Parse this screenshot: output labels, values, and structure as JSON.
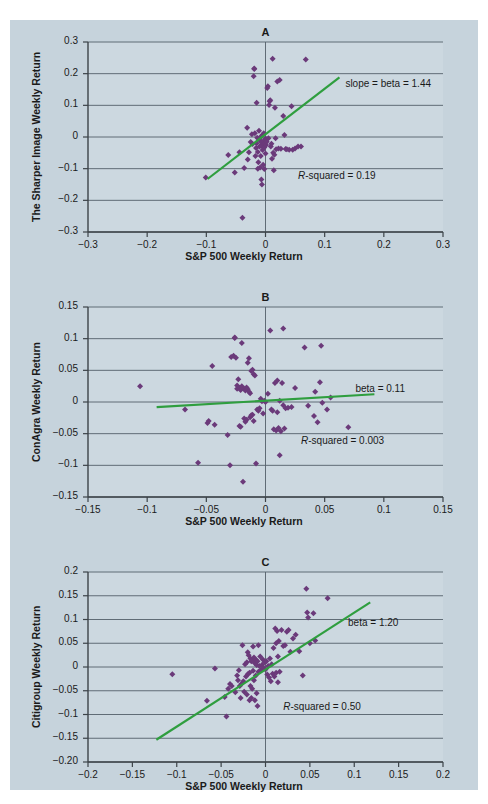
{
  "figure": {
    "background_color": "#c6d3dc",
    "plot_color": "#ccd8e0",
    "marker_color": "#6b3a7a",
    "line_color": "#2f9e3f",
    "axis_color": "#3c4348",
    "grid_color": "#54606a",
    "top_note": ""
  },
  "common": {
    "xlabel": "S&P 500 Weekly Return"
  },
  "chart_data": [
    {
      "id": "A",
      "type": "scatter",
      "title": "A",
      "xlabel": "S&P 500 Weekly Return",
      "ylabel": "The Sharper Image Weekly Return",
      "xlim": [
        -0.3,
        0.3
      ],
      "ylim": [
        -0.3,
        0.3
      ],
      "xticks": [
        -0.3,
        -0.2,
        -0.1,
        0,
        0.1,
        0.2,
        0.3
      ],
      "xticklabels": [
        "−0.3",
        "−0.2",
        "−0.1",
        "0",
        "0.1",
        "0.2",
        "0.3"
      ],
      "yticks": [
        -0.3,
        -0.2,
        -0.1,
        0,
        0.1,
        0.2,
        0.3
      ],
      "yticklabels": [
        "−0.3",
        "−0.2",
        "−0.1",
        "0",
        "0.1",
        "0.2",
        "0.3"
      ],
      "grid": "horizontal",
      "annotations": [
        {
          "name": "slope-annotation",
          "text": "slope = beta = 1.44",
          "x": 0.135,
          "y": 0.165
        },
        {
          "name": "rsquared-annotation",
          "text": "R-squared = 0.19",
          "italic_prefix": "R",
          "rest": "-squared = 0.19",
          "x": 0.055,
          "y": -0.125
        }
      ],
      "fit": {
        "slope": 1.44,
        "intercept": 0.0085,
        "x_start": -0.098,
        "x_end": 0.125
      },
      "beta": 1.44,
      "r_squared": 0.19,
      "points": [
        [
          -0.101,
          -0.128
        ],
        [
          -0.063,
          -0.057
        ],
        [
          -0.052,
          -0.112
        ],
        [
          -0.044,
          -0.048
        ],
        [
          -0.039,
          -0.255
        ],
        [
          -0.036,
          -0.098
        ],
        [
          -0.031,
          0.029
        ],
        [
          -0.03,
          -0.071
        ],
        [
          -0.028,
          -0.048
        ],
        [
          -0.025,
          -0.016
        ],
        [
          -0.023,
          0.009
        ],
        [
          -0.022,
          -0.022
        ],
        [
          -0.02,
          0.192
        ],
        [
          -0.019,
          0.215
        ],
        [
          -0.019,
          0.216
        ],
        [
          -0.018,
          0.012
        ],
        [
          -0.017,
          -0.06
        ],
        [
          -0.016,
          -0.035
        ],
        [
          -0.015,
          0.108
        ],
        [
          -0.015,
          -0.02
        ],
        [
          -0.014,
          -0.002
        ],
        [
          -0.013,
          -0.047
        ],
        [
          -0.013,
          -0.1
        ],
        [
          -0.012,
          -0.08
        ],
        [
          -0.011,
          0.02
        ],
        [
          -0.01,
          -0.005
        ],
        [
          -0.01,
          -0.03
        ],
        [
          -0.009,
          -0.012
        ],
        [
          -0.009,
          -0.096
        ],
        [
          -0.008,
          0.001
        ],
        [
          -0.008,
          -0.06
        ],
        [
          -0.007,
          -0.028
        ],
        [
          -0.007,
          -0.134
        ],
        [
          -0.006,
          -0.018
        ],
        [
          -0.006,
          -0.15
        ],
        [
          -0.005,
          0.006
        ],
        [
          -0.005,
          -0.041
        ],
        [
          -0.004,
          -0.022
        ],
        [
          -0.004,
          -0.088
        ],
        [
          -0.003,
          0.012
        ],
        [
          -0.003,
          -0.012
        ],
        [
          -0.002,
          -0.033
        ],
        [
          -0.002,
          -0.101
        ],
        [
          -0.001,
          -0.019
        ],
        [
          0.0,
          -0.005
        ],
        [
          0.0,
          -0.052
        ],
        [
          0.001,
          -0.025
        ],
        [
          0.002,
          -0.015
        ],
        [
          0.003,
          0.155
        ],
        [
          0.004,
          0.16
        ],
        [
          0.005,
          -0.004
        ],
        [
          0.006,
          0.101
        ],
        [
          0.007,
          0.113
        ],
        [
          0.008,
          0.116
        ],
        [
          0.009,
          -0.03
        ],
        [
          0.01,
          -0.021
        ],
        [
          0.011,
          -0.069
        ],
        [
          0.012,
          0.247
        ],
        [
          0.013,
          -0.05
        ],
        [
          0.014,
          -0.105
        ],
        [
          0.015,
          -0.056
        ],
        [
          0.016,
          0.092
        ],
        [
          0.017,
          -0.004
        ],
        [
          0.018,
          -0.039
        ],
        [
          0.02,
          0.175
        ],
        [
          0.022,
          -0.036
        ],
        [
          0.024,
          0.18
        ],
        [
          0.026,
          -0.037
        ],
        [
          0.03,
          0.066
        ],
        [
          0.032,
          0.006
        ],
        [
          0.034,
          -0.038
        ],
        [
          0.036,
          -0.039
        ],
        [
          0.04,
          -0.04
        ],
        [
          0.044,
          0.097
        ],
        [
          0.046,
          -0.04
        ],
        [
          0.05,
          -0.036
        ],
        [
          0.055,
          -0.03
        ],
        [
          0.06,
          -0.03
        ],
        [
          0.068,
          0.245
        ]
      ]
    },
    {
      "id": "B",
      "type": "scatter",
      "title": "B",
      "xlabel": "S&P 500 Weekly Return",
      "ylabel": "ConAgra Weekly Return",
      "xlim": [
        -0.15,
        0.15
      ],
      "ylim": [
        -0.15,
        0.15
      ],
      "xticks": [
        -0.15,
        -0.1,
        -0.05,
        0,
        0.05,
        0.1,
        0.15
      ],
      "xticklabels": [
        "−0.15",
        "−0.1",
        "−0.05",
        "0",
        "0.05",
        "0.1",
        "0.15"
      ],
      "yticks": [
        -0.15,
        -0.1,
        -0.05,
        0,
        0.05,
        0.1,
        0.15
      ],
      "yticklabels": [
        "−0.15",
        "−0.1",
        "−0.05",
        "0",
        "0.05",
        "0.1",
        "0.15"
      ],
      "grid": "horizontal",
      "annotations": [
        {
          "name": "beta-annotation",
          "text": "beta = 0.11",
          "x": 0.076,
          "y": 0.019
        },
        {
          "name": "rsquared-annotation",
          "text": "R-squared = 0.003",
          "italic_prefix": "R",
          "rest": "-squared = 0.003",
          "x": 0.03,
          "y": -0.063
        }
      ],
      "fit": {
        "slope": 0.11,
        "intercept": 0.0021,
        "x_start": -0.092,
        "x_end": 0.092
      },
      "beta": 0.11,
      "r_squared": 0.003,
      "points": [
        [
          -0.106,
          0.025
        ],
        [
          -0.068,
          -0.012
        ],
        [
          -0.057,
          -0.096
        ],
        [
          -0.049,
          -0.033
        ],
        [
          -0.048,
          -0.03
        ],
        [
          -0.045,
          0.057
        ],
        [
          -0.043,
          -0.036
        ],
        [
          -0.032,
          -0.052
        ],
        [
          -0.03,
          -0.1
        ],
        [
          -0.029,
          0.071
        ],
        [
          -0.027,
          0.073
        ],
        [
          -0.026,
          0.101
        ],
        [
          -0.026,
          0.102
        ],
        [
          -0.025,
          0.07
        ],
        [
          -0.024,
          0.026
        ],
        [
          -0.024,
          0.021
        ],
        [
          -0.023,
          0.036
        ],
        [
          -0.022,
          0.022
        ],
        [
          -0.022,
          -0.038
        ],
        [
          -0.021,
          0.019
        ],
        [
          -0.021,
          -0.039
        ],
        [
          -0.02,
          0.025
        ],
        [
          -0.02,
          0.093
        ],
        [
          -0.019,
          -0.126
        ],
        [
          -0.018,
          0.021
        ],
        [
          -0.018,
          -0.026
        ],
        [
          -0.017,
          0.018
        ],
        [
          -0.017,
          -0.031
        ],
        [
          -0.016,
          0.023
        ],
        [
          -0.016,
          -0.028
        ],
        [
          -0.015,
          0.02
        ],
        [
          -0.015,
          0.062
        ],
        [
          -0.014,
          0.016
        ],
        [
          -0.014,
          0.069
        ],
        [
          -0.013,
          0.014
        ],
        [
          -0.013,
          -0.024
        ],
        [
          -0.012,
          0.049
        ],
        [
          -0.012,
          -0.021
        ],
        [
          -0.011,
          0.051
        ],
        [
          -0.011,
          -0.02
        ],
        [
          -0.01,
          0.044
        ],
        [
          -0.01,
          -0.03
        ],
        [
          -0.009,
          0.042
        ],
        [
          -0.008,
          -0.097
        ],
        [
          -0.007,
          -0.012
        ],
        [
          -0.006,
          -0.014
        ],
        [
          -0.005,
          -0.01
        ],
        [
          -0.004,
          0.005
        ],
        [
          -0.003,
          0.001
        ],
        [
          -0.002,
          -0.018
        ],
        [
          -0.001,
          0.002
        ],
        [
          0.0,
          0.0
        ],
        [
          0.002,
          0.013
        ],
        [
          0.004,
          0.113
        ],
        [
          0.005,
          -0.012
        ],
        [
          0.006,
          -0.014
        ],
        [
          0.007,
          -0.043
        ],
        [
          0.008,
          0.03
        ],
        [
          0.009,
          -0.045
        ],
        [
          0.01,
          0.034
        ],
        [
          0.01,
          -0.016
        ],
        [
          0.011,
          -0.041
        ],
        [
          0.012,
          0.002
        ],
        [
          0.012,
          -0.084
        ],
        [
          0.013,
          -0.046
        ],
        [
          0.014,
          0.03
        ],
        [
          0.015,
          0.116
        ],
        [
          0.015,
          -0.005
        ],
        [
          0.016,
          -0.042
        ],
        [
          0.017,
          -0.01
        ],
        [
          0.019,
          -0.009
        ],
        [
          0.022,
          -0.008
        ],
        [
          0.025,
          0.022
        ],
        [
          0.033,
          0.086
        ],
        [
          0.036,
          -0.006
        ],
        [
          0.041,
          -0.022
        ],
        [
          0.042,
          0.016
        ],
        [
          0.044,
          -0.032
        ],
        [
          0.046,
          0.031
        ],
        [
          0.047,
          0.089
        ],
        [
          0.048,
          -0.001
        ],
        [
          0.052,
          -0.012
        ],
        [
          0.055,
          0.007
        ],
        [
          0.07,
          -0.04
        ]
      ]
    },
    {
      "id": "C",
      "type": "scatter",
      "title": "C",
      "xlabel": "S&P 500 Weekly Return",
      "ylabel": "Citigroup Weekly Return",
      "xlim": [
        -0.2,
        0.2
      ],
      "ylim": [
        -0.2,
        0.2
      ],
      "xticks": [
        -0.2,
        -0.15,
        -0.1,
        -0.05,
        0,
        0.05,
        0.1,
        0.15,
        0.2
      ],
      "xticklabels": [
        "−0.2",
        "−0.15",
        "−0.1",
        "−0.05",
        "0",
        "0.05",
        "0.1",
        "0.15",
        "0.2"
      ],
      "yticks": [
        -0.2,
        -0.15,
        -0.1,
        -0.05,
        0,
        0.05,
        0.1,
        0.15,
        0.2
      ],
      "yticklabels": [
        "−0.20",
        "−0.15",
        "−0.1",
        "−0.05",
        "0",
        "0.05",
        "0.1",
        "0.15",
        "0.2"
      ],
      "grid": "horizontal",
      "annotations": [
        {
          "name": "beta-annotation",
          "text": "beta = 1.20",
          "x": 0.093,
          "y": 0.09
        },
        {
          "name": "rsquared-annotation",
          "text": "R-squared = 0.50",
          "italic_prefix": "R",
          "rest": "-squared = 0.50",
          "x": 0.02,
          "y": -0.086
        }
      ],
      "fit": {
        "slope": 1.2,
        "intercept": -0.0055,
        "x_start": -0.123,
        "x_end": 0.118
      },
      "beta": 1.2,
      "r_squared": 0.5,
      "points": [
        [
          -0.105,
          -0.015
        ],
        [
          -0.066,
          -0.071
        ],
        [
          -0.057,
          -0.003
        ],
        [
          -0.046,
          -0.063
        ],
        [
          -0.044,
          -0.104
        ],
        [
          -0.042,
          -0.046
        ],
        [
          -0.04,
          -0.036
        ],
        [
          -0.038,
          -0.04
        ],
        [
          -0.034,
          -0.053
        ],
        [
          -0.032,
          -0.018
        ],
        [
          -0.031,
          -0.028
        ],
        [
          -0.03,
          -0.007
        ],
        [
          -0.029,
          -0.04
        ],
        [
          -0.028,
          -0.065
        ],
        [
          -0.027,
          -0.035
        ],
        [
          -0.026,
          0.046
        ],
        [
          -0.025,
          -0.03
        ],
        [
          -0.024,
          -0.052
        ],
        [
          -0.023,
          0.006
        ],
        [
          -0.022,
          -0.02
        ],
        [
          -0.021,
          0.01
        ],
        [
          -0.021,
          -0.058
        ],
        [
          -0.02,
          0.031
        ],
        [
          -0.02,
          -0.015
        ],
        [
          -0.019,
          0.025
        ],
        [
          -0.018,
          -0.012
        ],
        [
          -0.018,
          -0.07
        ],
        [
          -0.017,
          0.018
        ],
        [
          -0.017,
          -0.04
        ],
        [
          -0.016,
          0.012
        ],
        [
          -0.016,
          -0.065
        ],
        [
          -0.015,
          0.014
        ],
        [
          -0.015,
          -0.046
        ],
        [
          -0.014,
          0.043
        ],
        [
          -0.014,
          -0.008
        ],
        [
          -0.013,
          0.02
        ],
        [
          -0.013,
          -0.028
        ],
        [
          -0.012,
          0.008
        ],
        [
          -0.012,
          -0.07
        ],
        [
          -0.011,
          0.016
        ],
        [
          -0.011,
          -0.018
        ],
        [
          -0.01,
          0.004
        ],
        [
          -0.01,
          -0.055
        ],
        [
          -0.009,
          0.012
        ],
        [
          -0.009,
          -0.082
        ],
        [
          -0.008,
          0.046
        ],
        [
          -0.008,
          -0.01
        ],
        [
          -0.007,
          0.002
        ],
        [
          -0.006,
          0.022
        ],
        [
          -0.005,
          -0.006
        ],
        [
          -0.004,
          0.004
        ],
        [
          -0.003,
          0.016
        ],
        [
          -0.002,
          -0.002
        ],
        [
          -0.001,
          0.01
        ],
        [
          0.0,
          -0.005
        ],
        [
          0.001,
          0.012
        ],
        [
          0.002,
          -0.016
        ],
        [
          0.003,
          0.002
        ],
        [
          0.004,
          -0.022
        ],
        [
          0.005,
          0.018
        ],
        [
          0.006,
          -0.03
        ],
        [
          0.007,
          0.006
        ],
        [
          0.008,
          -0.014
        ],
        [
          0.009,
          0.04
        ],
        [
          0.01,
          -0.02
        ],
        [
          0.011,
          0.081
        ],
        [
          0.012,
          0.05
        ],
        [
          0.012,
          -0.012
        ],
        [
          0.013,
          0.076
        ],
        [
          0.014,
          0.022
        ],
        [
          0.014,
          -0.032
        ],
        [
          0.015,
          0.055
        ],
        [
          0.016,
          -0.01
        ],
        [
          0.018,
          0.078
        ],
        [
          0.02,
          0.044
        ],
        [
          0.022,
          0.046
        ],
        [
          0.024,
          0.074
        ],
        [
          0.026,
          0.078
        ],
        [
          0.028,
          0.032
        ],
        [
          0.031,
          0.06
        ],
        [
          0.034,
          0.068
        ],
        [
          0.038,
          0.033
        ],
        [
          0.042,
          -0.018
        ],
        [
          0.046,
          0.165
        ],
        [
          0.047,
          0.115
        ],
        [
          0.048,
          0.104
        ],
        [
          0.05,
          0.05
        ],
        [
          0.054,
          0.113
        ],
        [
          0.056,
          0.056
        ],
        [
          0.07,
          0.145
        ]
      ]
    }
  ]
}
